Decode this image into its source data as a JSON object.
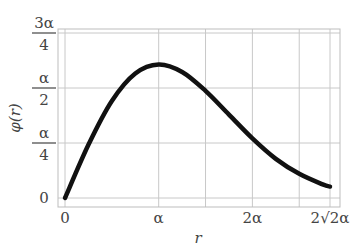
{
  "chart_data": {
    "type": "line",
    "title": "",
    "xlabel": "r",
    "ylabel": "φ(r)",
    "function": "φ(r) = r·exp(−r²/(2α²))",
    "xlim": [
      0,
      2.8284
    ],
    "ylim": [
      0,
      0.75
    ],
    "x_unit": "α",
    "y_unit": "α",
    "grid": true,
    "x_ticks": [
      {
        "value": 0,
        "label": "0"
      },
      {
        "value": 1,
        "label": "α"
      },
      {
        "value": 2,
        "label": "2α"
      },
      {
        "value": 2.8284,
        "label": "2√2α"
      }
    ],
    "x_minor_gridlines": [
      1.5,
      2.5
    ],
    "y_ticks": [
      {
        "value": 0,
        "label": "0",
        "num": "0",
        "den": ""
      },
      {
        "value": 0.25,
        "label": "α/4",
        "num": "α",
        "den": "4"
      },
      {
        "value": 0.5,
        "label": "α/2",
        "num": "α",
        "den": "2"
      },
      {
        "value": 0.75,
        "label": "3α/4",
        "num": "3α",
        "den": "4"
      }
    ],
    "series": [
      {
        "name": "φ(r)",
        "x": [
          0,
          0.25,
          0.5,
          0.75,
          1.0,
          1.25,
          1.5,
          1.75,
          2.0,
          2.25,
          2.5,
          2.75,
          2.8284
        ],
        "y": [
          0,
          0.242,
          0.441,
          0.566,
          0.607,
          0.573,
          0.487,
          0.379,
          0.271,
          0.178,
          0.11,
          0.062,
          0.052
        ]
      }
    ]
  }
}
